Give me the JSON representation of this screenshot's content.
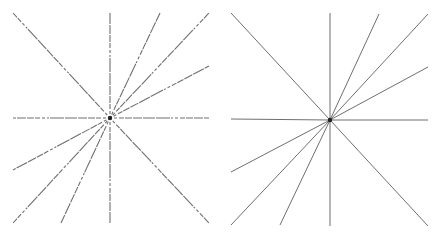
{
  "figure": {
    "line_color": "#6f6f6f",
    "center_color": "#222222",
    "background": "#ffffff"
  },
  "panels": [
    {
      "id": "left",
      "style": "dashed",
      "center": [
        110,
        118
      ],
      "lines": [
        {
          "from": [
            13,
            13
          ],
          "to": [
            209,
            223
          ]
        },
        {
          "from": [
            110,
            13
          ],
          "to": [
            110,
            223
          ]
        },
        {
          "from": [
            160,
            13
          ],
          "to": [
            61,
            223
          ]
        },
        {
          "from": [
            209,
            13
          ],
          "to": [
            13,
            223
          ]
        },
        {
          "from": [
            209,
            66
          ],
          "to": [
            13,
            170
          ]
        },
        {
          "from": [
            13,
            118
          ],
          "to": [
            209,
            118
          ]
        }
      ]
    },
    {
      "id": "right",
      "style": "solid",
      "center": [
        111,
        120
      ],
      "lines": [
        {
          "from": [
            12,
            13
          ],
          "to": [
            209,
            226
          ]
        },
        {
          "from": [
            111,
            13
          ],
          "to": [
            111,
            226
          ]
        },
        {
          "from": [
            160,
            14
          ],
          "to": [
            61,
            225
          ]
        },
        {
          "from": [
            209,
            14
          ],
          "to": [
            12,
            225
          ]
        },
        {
          "from": [
            209,
            67
          ],
          "to": [
            12,
            172
          ]
        },
        {
          "from": [
            12,
            119
          ],
          "to": [
            209,
            120
          ]
        }
      ]
    }
  ]
}
